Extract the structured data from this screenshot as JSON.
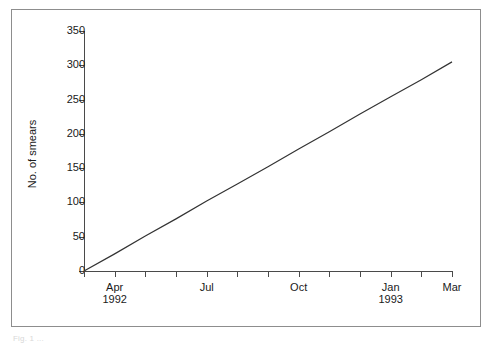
{
  "figure": {
    "caption_fragment": "Fig. 1 ...",
    "frame_color": "#8d8d8d",
    "background": "#ffffff"
  },
  "axes": {
    "y_title": "No. of smears",
    "y_ticks": [
      "0",
      "50",
      "100",
      "150",
      "200",
      "250",
      "300",
      "350"
    ],
    "x_tick_labels": [
      {
        "index": 1,
        "text": "Apr\n1992"
      },
      {
        "index": 4,
        "text": "Jul"
      },
      {
        "index": 7,
        "text": "Oct"
      },
      {
        "index": 10,
        "text": "Jan\n1993"
      },
      {
        "index": 12,
        "text": "Mar"
      }
    ],
    "x_tick_count": 13
  },
  "chart_data": {
    "type": "line",
    "title": "",
    "subtitle": "",
    "xlabel": "",
    "ylabel": "No. of smears",
    "ylim": [
      0,
      350
    ],
    "yticks": [
      0,
      50,
      100,
      150,
      200,
      250,
      300,
      350
    ],
    "grid": false,
    "legend": null,
    "x": [
      "Mar 1992",
      "Apr 1992",
      "May 1992",
      "Jun 1992",
      "Jul 1992",
      "Aug 1992",
      "Sep 1992",
      "Oct 1992",
      "Nov 1992",
      "Dec 1992",
      "Jan 1993",
      "Feb 1993",
      "Mar 1993"
    ],
    "xtick_labels": [
      "",
      "Apr 1992",
      "",
      "",
      "Jul",
      "",
      "",
      "Oct",
      "",
      "",
      "Jan 1993",
      "",
      "Mar"
    ],
    "series": [
      {
        "name": "Cumulative smears",
        "color": "#333333",
        "values": [
          0,
          25,
          51,
          76,
          102,
          127,
          152,
          178,
          203,
          229,
          254,
          279,
          305
        ]
      }
    ],
    "annotations": []
  }
}
